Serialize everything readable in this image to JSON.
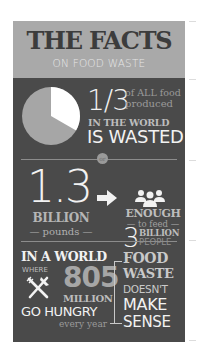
{
  "header": {
    "title": "THE FACTS",
    "subtitle": "ON FOOD WASTE"
  },
  "fact1": {
    "fraction": "1/3",
    "of_all": "of ALL food",
    "produced": "produced",
    "in_the_world": "IN THE WORLD",
    "is_wasted": "IS WASTED",
    "pie": {
      "wasted_fraction": 0.3333,
      "wasted_color": "#ffffff",
      "rest_color": "#a6a6a6"
    }
  },
  "separator": {
    "label": "or"
  },
  "fact2": {
    "amount": "1.3",
    "unit": "BILLION",
    "unit_sub": "— pounds —",
    "enough": "ENOUGH",
    "to_feed": "— to feed —",
    "people_count": "3",
    "billion": "BILLION",
    "people": "PEOPLE",
    "icons": [
      "arrow-right-icon",
      "people-group-icon"
    ]
  },
  "fact3": {
    "in_a_world": "IN A WORLD",
    "where": "WHERE",
    "number": "805",
    "million": "MILLION",
    "go_hungry": "GO HUNGRY",
    "every_year": "every year",
    "conclusion": [
      "FOOD",
      "WASTE",
      "DOESN'T",
      "MAKE",
      "SENSE"
    ],
    "icons": [
      "fork-knife-icon"
    ]
  },
  "colors": {
    "panel": "#4a4a4a",
    "header": "#a9a9a9",
    "title": "#3c3c3c",
    "text_light": "#f2f2f2",
    "text_muted": "#bdbdbd"
  }
}
